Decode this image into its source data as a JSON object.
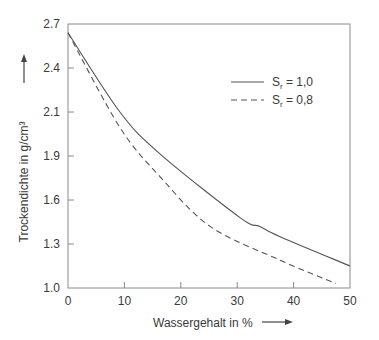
{
  "chart_data": {
    "type": "line",
    "title": "",
    "xlabel": "Wassergehalt in %",
    "ylabel": "Trockendichte in g/cm³",
    "xlim": [
      0,
      50
    ],
    "x_ticks": [
      "0",
      "10",
      "20",
      "30",
      "40",
      "50"
    ],
    "y_ticks": [
      "2.7",
      "2.4",
      "2.1",
      "1.9",
      "1.6",
      "1.3",
      "1.0"
    ],
    "grid": false,
    "legend_position": "upper right",
    "series": [
      {
        "name": "Sr = 1,0",
        "style": "solid",
        "x": [
          0,
          9.2,
          16.3,
          30.5,
          34,
          37.6,
          50
        ],
        "y": [
          2.64,
          2.1,
          1.91,
          1.48,
          1.42,
          1.35,
          1.15
        ]
      },
      {
        "name": "Sr = 0,8",
        "style": "dashed",
        "x": [
          0,
          9.2,
          16.3,
          25.2,
          37.6,
          47.5
        ],
        "y": [
          2.64,
          2.03,
          1.76,
          1.42,
          1.19,
          1.03
        ]
      }
    ]
  },
  "legend": {
    "items": [
      {
        "base": "S",
        "sub": "r",
        "rest": " = 1,0",
        "style": "solid"
      },
      {
        "base": "S",
        "sub": "r",
        "rest": " = 0,8",
        "style": "dashed"
      }
    ]
  },
  "colors": {
    "line": "#555555",
    "axis": "#8a8a8a",
    "text": "#3a3a3a"
  }
}
